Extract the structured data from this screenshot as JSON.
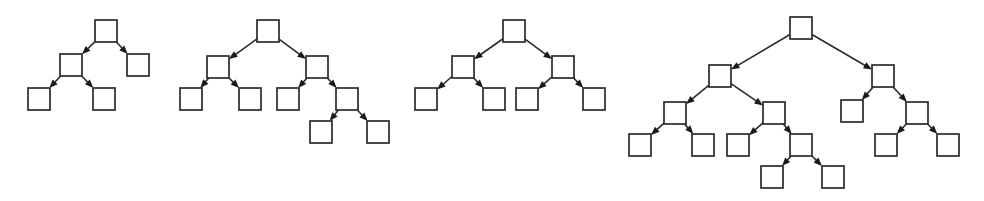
{
  "figure": {
    "title": "",
    "background_color": "#ffffff",
    "node_fill_color": "#ffffff",
    "node_stroke_color": "#2b2b2b",
    "edge_color": "#2b2b2b",
    "arrow_color": "#1a1a1a",
    "node_width": 22,
    "node_height": 22,
    "canvas": {
      "width": 984,
      "height": 201
    }
  },
  "diagram_data": {
    "type": "diagram",
    "diagram_kind": "directed-binary-tree-set",
    "description": "Four directed binary tree diagrams drawn left to right, each composed of empty square nodes connected by straight arrows pointing from parent to child.",
    "tree_count": 4,
    "trees": [
      {
        "id": "tree-1",
        "label": "",
        "node_count": 5,
        "leaf_count": 3,
        "internal_count": 2,
        "depth": 2,
        "nodes": [
          {
            "id": "t1-n1",
            "role": "root",
            "depth": 0,
            "x": 95,
            "y": 20
          },
          {
            "id": "t1-n2",
            "role": "internal",
            "depth": 1,
            "x": 60,
            "y": 54
          },
          {
            "id": "t1-n3",
            "role": "leaf",
            "depth": 1,
            "x": 127,
            "y": 54
          },
          {
            "id": "t1-n4",
            "role": "leaf",
            "depth": 2,
            "x": 28,
            "y": 88
          },
          {
            "id": "t1-n5",
            "role": "leaf",
            "depth": 2,
            "x": 93,
            "y": 88
          }
        ],
        "edges": [
          {
            "from": "t1-n1",
            "to": "t1-n2"
          },
          {
            "from": "t1-n1",
            "to": "t1-n3"
          },
          {
            "from": "t1-n2",
            "to": "t1-n4"
          },
          {
            "from": "t1-n2",
            "to": "t1-n5"
          }
        ]
      },
      {
        "id": "tree-2",
        "label": "",
        "node_count": 9,
        "leaf_count": 5,
        "internal_count": 4,
        "depth": 3,
        "nodes": [
          {
            "id": "t2-n1",
            "role": "root",
            "depth": 0,
            "x": 257,
            "y": 20
          },
          {
            "id": "t2-n2",
            "role": "internal",
            "depth": 1,
            "x": 207,
            "y": 56
          },
          {
            "id": "t2-n3",
            "role": "internal",
            "depth": 1,
            "x": 306,
            "y": 56
          },
          {
            "id": "t2-n4",
            "role": "leaf",
            "depth": 2,
            "x": 180,
            "y": 88
          },
          {
            "id": "t2-n5",
            "role": "leaf",
            "depth": 2,
            "x": 239,
            "y": 88
          },
          {
            "id": "t2-n6",
            "role": "leaf",
            "depth": 2,
            "x": 277,
            "y": 88
          },
          {
            "id": "t2-n7",
            "role": "internal",
            "depth": 2,
            "x": 336,
            "y": 88
          },
          {
            "id": "t2-n8",
            "role": "leaf",
            "depth": 3,
            "x": 310,
            "y": 121
          },
          {
            "id": "t2-n9",
            "role": "leaf",
            "depth": 3,
            "x": 367,
            "y": 121
          }
        ],
        "edges": [
          {
            "from": "t2-n1",
            "to": "t2-n2"
          },
          {
            "from": "t2-n1",
            "to": "t2-n3"
          },
          {
            "from": "t2-n2",
            "to": "t2-n4"
          },
          {
            "from": "t2-n2",
            "to": "t2-n5"
          },
          {
            "from": "t2-n3",
            "to": "t2-n6"
          },
          {
            "from": "t2-n3",
            "to": "t2-n7"
          },
          {
            "from": "t2-n7",
            "to": "t2-n8"
          },
          {
            "from": "t2-n7",
            "to": "t2-n9"
          }
        ]
      },
      {
        "id": "tree-3",
        "label": "",
        "node_count": 7,
        "leaf_count": 4,
        "internal_count": 3,
        "depth": 2,
        "nodes": [
          {
            "id": "t3-n1",
            "role": "root",
            "depth": 0,
            "x": 503,
            "y": 20
          },
          {
            "id": "t3-n2",
            "role": "internal",
            "depth": 1,
            "x": 452,
            "y": 56
          },
          {
            "id": "t3-n3",
            "role": "internal",
            "depth": 1,
            "x": 552,
            "y": 56
          },
          {
            "id": "t3-n4",
            "role": "leaf",
            "depth": 2,
            "x": 415,
            "y": 88
          },
          {
            "id": "t3-n5",
            "role": "leaf",
            "depth": 2,
            "x": 483,
            "y": 88
          },
          {
            "id": "t3-n6",
            "role": "leaf",
            "depth": 2,
            "x": 516,
            "y": 88
          },
          {
            "id": "t3-n7",
            "role": "leaf",
            "depth": 2,
            "x": 583,
            "y": 88
          }
        ],
        "edges": [
          {
            "from": "t3-n1",
            "to": "t3-n2"
          },
          {
            "from": "t3-n1",
            "to": "t3-n3"
          },
          {
            "from": "t3-n2",
            "to": "t3-n4"
          },
          {
            "from": "t3-n2",
            "to": "t3-n5"
          },
          {
            "from": "t3-n3",
            "to": "t3-n6"
          },
          {
            "from": "t3-n3",
            "to": "t3-n7"
          }
        ]
      },
      {
        "id": "tree-4",
        "label": "",
        "node_count": 17,
        "leaf_count": 9,
        "internal_count": 8,
        "depth": 4,
        "nodes": [
          {
            "id": "t4-n1",
            "role": "root",
            "depth": 0,
            "x": 790,
            "y": 17
          },
          {
            "id": "t4-n2",
            "role": "internal",
            "depth": 1,
            "x": 709,
            "y": 65
          },
          {
            "id": "t4-n3",
            "role": "internal",
            "depth": 1,
            "x": 872,
            "y": 65
          },
          {
            "id": "t4-n4",
            "role": "internal",
            "depth": 2,
            "x": 664,
            "y": 102
          },
          {
            "id": "t4-n5",
            "role": "internal",
            "depth": 2,
            "x": 763,
            "y": 102
          },
          {
            "id": "t4-n6",
            "role": "leaf",
            "depth": 2,
            "x": 841,
            "y": 100
          },
          {
            "id": "t4-n7",
            "role": "internal",
            "depth": 2,
            "x": 906,
            "y": 102
          },
          {
            "id": "t4-n8",
            "role": "leaf",
            "depth": 3,
            "x": 629,
            "y": 134
          },
          {
            "id": "t4-n9",
            "role": "leaf",
            "depth": 3,
            "x": 692,
            "y": 134
          },
          {
            "id": "t4-n10",
            "role": "leaf",
            "depth": 3,
            "x": 727,
            "y": 134
          },
          {
            "id": "t4-n11",
            "role": "internal",
            "depth": 3,
            "x": 790,
            "y": 134
          },
          {
            "id": "t4-n12",
            "role": "leaf",
            "depth": 3,
            "x": 875,
            "y": 134
          },
          {
            "id": "t4-n13",
            "role": "leaf",
            "depth": 3,
            "x": 937,
            "y": 134
          },
          {
            "id": "t4-n14",
            "role": "leaf",
            "depth": 4,
            "x": 761,
            "y": 166
          },
          {
            "id": "t4-n15",
            "role": "leaf",
            "depth": 4,
            "x": 822,
            "y": 166
          }
        ],
        "edges": [
          {
            "from": "t4-n1",
            "to": "t4-n2"
          },
          {
            "from": "t4-n1",
            "to": "t4-n3"
          },
          {
            "from": "t4-n2",
            "to": "t4-n4"
          },
          {
            "from": "t4-n2",
            "to": "t4-n5"
          },
          {
            "from": "t4-n3",
            "to": "t4-n6"
          },
          {
            "from": "t4-n3",
            "to": "t4-n7"
          },
          {
            "from": "t4-n4",
            "to": "t4-n8"
          },
          {
            "from": "t4-n4",
            "to": "t4-n9"
          },
          {
            "from": "t4-n5",
            "to": "t4-n10"
          },
          {
            "from": "t4-n5",
            "to": "t4-n11"
          },
          {
            "from": "t4-n7",
            "to": "t4-n12"
          },
          {
            "from": "t4-n7",
            "to": "t4-n13"
          },
          {
            "from": "t4-n11",
            "to": "t4-n14"
          },
          {
            "from": "t4-n11",
            "to": "t4-n15"
          }
        ]
      }
    ]
  }
}
